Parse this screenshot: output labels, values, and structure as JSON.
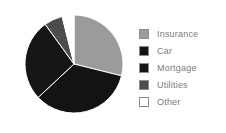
{
  "chart_data": {
    "type": "pie",
    "title": "",
    "categories": [
      "Insurance",
      "Car",
      "Mortgage",
      "Utilities",
      "Other"
    ],
    "values": [
      29,
      34,
      27,
      6,
      4
    ],
    "units": "percent",
    "start_angle_deg": 0,
    "direction": "clockwise",
    "legend_position": "right",
    "grid": false,
    "slice_colors": [
      "#9b9b9b",
      "#131313",
      "#161616",
      "#4c4c4c",
      "#ffffff"
    ],
    "slices": [
      {
        "label": "Insurance",
        "value": 29,
        "color": "#9b9b9b",
        "start_deg": 0,
        "end_deg": 104
      },
      {
        "label": "Car",
        "value": 34,
        "color": "#131313",
        "start_deg": 104,
        "end_deg": 227
      },
      {
        "label": "Mortgage",
        "value": 27,
        "color": "#161616",
        "start_deg": 227,
        "end_deg": 324
      },
      {
        "label": "Utilities",
        "value": 6,
        "color": "#4c4c4c",
        "start_deg": 324,
        "end_deg": 346
      },
      {
        "label": "Other",
        "value": 4,
        "color": "#ffffff",
        "start_deg": 346,
        "end_deg": 360
      }
    ]
  },
  "legend": {
    "items": [
      {
        "label": "Insurance",
        "color": "#9b9b9b",
        "swatch_name": "legend-swatch-insurance"
      },
      {
        "label": "Car",
        "color": "#131313",
        "swatch_name": "legend-swatch-car"
      },
      {
        "label": "Mortgage",
        "color": "#161616",
        "swatch_name": "legend-swatch-mortgage"
      },
      {
        "label": "Utilities",
        "color": "#4c4c4c",
        "swatch_name": "legend-swatch-utilities"
      },
      {
        "label": "Other",
        "color": "#ffffff",
        "swatch_name": "legend-swatch-other"
      }
    ]
  },
  "style": {
    "background": "#ffffff",
    "text_color": "#7c7c7c",
    "slice_edge_color": "#ffffff"
  }
}
